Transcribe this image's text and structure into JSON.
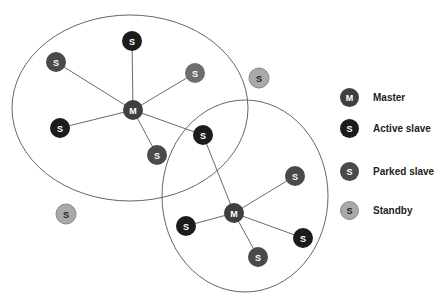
{
  "diagram": {
    "colors": {
      "master": "#3f3f3f",
      "active_slave": "#1c1c1c",
      "parked_slave": "#4a4a4a",
      "standby": "#a9a9a9",
      "line": "#6a6a6a",
      "ellipse": "#555555"
    },
    "piconets": [
      {
        "name": "piconet-1",
        "ellipse": {
          "cx": 130,
          "cy": 108,
          "rx": 118,
          "ry": 93
        },
        "master": {
          "x": 133,
          "y": 110,
          "label": "M"
        },
        "slaves": [
          {
            "x": 132,
            "y": 41,
            "label": "S",
            "type": "active_slave"
          },
          {
            "x": 56,
            "y": 62,
            "label": "S",
            "type": "parked_slave"
          },
          {
            "x": 195,
            "y": 73,
            "label": "S",
            "type": "standby_in"
          },
          {
            "x": 60,
            "y": 128,
            "label": "S",
            "type": "active_slave"
          },
          {
            "x": 157,
            "y": 155,
            "label": "S",
            "type": "parked_slave"
          },
          {
            "x": 203,
            "y": 135,
            "label": "S",
            "type": "active_slave"
          }
        ]
      },
      {
        "name": "piconet-2",
        "ellipse": {
          "cx": 245,
          "cy": 196,
          "rx": 83,
          "ry": 96
        },
        "master": {
          "x": 234,
          "y": 213,
          "label": "M"
        },
        "slaves": [
          {
            "x": 203,
            "y": 135,
            "label": "S",
            "type": "active_slave"
          },
          {
            "x": 295,
            "y": 176,
            "label": "S",
            "type": "parked_slave"
          },
          {
            "x": 186,
            "y": 226,
            "label": "S",
            "type": "active_slave"
          },
          {
            "x": 303,
            "y": 238,
            "label": "S",
            "type": "active_slave"
          },
          {
            "x": 258,
            "y": 257,
            "label": "S",
            "type": "parked_slave"
          }
        ]
      }
    ],
    "standby_nodes": [
      {
        "x": 259,
        "y": 78,
        "label": "S"
      },
      {
        "x": 66,
        "y": 214,
        "label": "S"
      }
    ]
  },
  "legend": [
    {
      "symbol": "M",
      "label": "Master",
      "type": "master"
    },
    {
      "symbol": "S",
      "label": "Active slave",
      "type": "active_slave"
    },
    {
      "symbol": "S",
      "label": "Parked slave",
      "type": "parked_slave"
    },
    {
      "symbol": "S",
      "label": "Standby",
      "type": "standby"
    }
  ]
}
